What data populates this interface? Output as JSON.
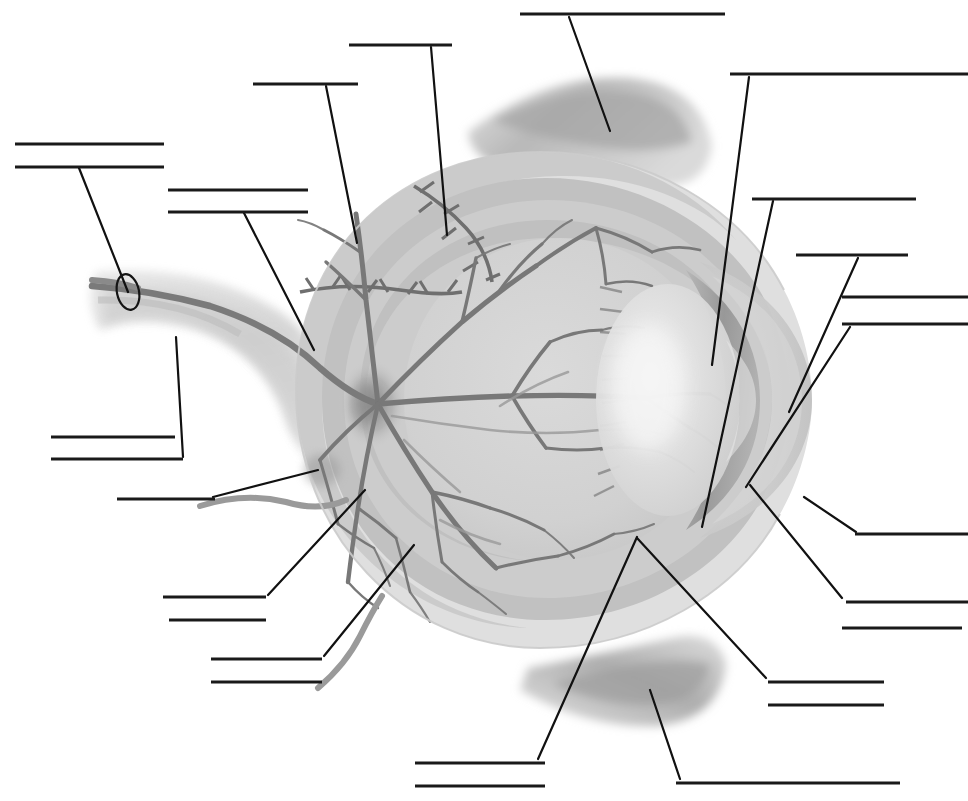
{
  "document": {
    "title": "Human Eye Anatomy - Blank Labeling Worksheet",
    "type": "unlabeled anatomical diagram",
    "orientation": "sagittal cross-section, anterior pole facing right",
    "rendering": "grayscale medical illustration",
    "width": 968,
    "height": 801
  },
  "palette": {
    "background": "#ffffff",
    "rule_line": "#1a1a1a",
    "leader_line": "#111111",
    "sclera_outer": "#dcdcdc",
    "sclera_shadow": "#c6c6c6",
    "choroid": "#bdbdbd",
    "retina_fill": "#cfcfcf",
    "vitreous": "#d4d4d4",
    "lens_highlight": "#f2f2f2",
    "cornea": "#c9c9c9",
    "iris_dark": "#9e9e9e",
    "muscle": "#b3b3b3",
    "muscle_dark": "#9a9a9a",
    "optic_nerve": "#d0d0d0",
    "vessel": "#7d7d7d",
    "vessel_dark": "#6b6b6b",
    "ciliary": "#6f6f6f",
    "marker_circle": "#151515"
  },
  "answer_lines": [
    {
      "id": 1,
      "text": "",
      "x1": 15,
      "y1": 144,
      "x2": 164,
      "y2": 144,
      "group": "left-upper"
    },
    {
      "id": 2,
      "text": "",
      "x1": 15,
      "y1": 167,
      "x2": 164,
      "y2": 167,
      "group": "left-upper"
    },
    {
      "id": 3,
      "text": "",
      "x1": 168,
      "y1": 190,
      "x2": 308,
      "y2": 190,
      "group": "left-mid"
    },
    {
      "id": 4,
      "text": "",
      "x1": 168,
      "y1": 212,
      "x2": 308,
      "y2": 212,
      "group": "left-mid"
    },
    {
      "id": 5,
      "text": "",
      "x1": 253,
      "y1": 84,
      "x2": 358,
      "y2": 84,
      "group": "top-left"
    },
    {
      "id": 6,
      "text": "",
      "x1": 349,
      "y1": 45,
      "x2": 452,
      "y2": 45,
      "group": "top-left"
    },
    {
      "id": 7,
      "text": "",
      "x1": 520,
      "y1": 14,
      "x2": 725,
      "y2": 14,
      "group": "top-center"
    },
    {
      "id": 8,
      "text": "",
      "x1": 730,
      "y1": 74,
      "x2": 968,
      "y2": 74,
      "group": "top-right"
    },
    {
      "id": 9,
      "text": "",
      "x1": 752,
      "y1": 199,
      "x2": 916,
      "y2": 199,
      "group": "right-upper"
    },
    {
      "id": 10,
      "text": "",
      "x1": 796,
      "y1": 255,
      "x2": 908,
      "y2": 255,
      "group": "right-upper"
    },
    {
      "id": 11,
      "text": "",
      "x1": 842,
      "y1": 297,
      "x2": 968,
      "y2": 297,
      "group": "right-mid"
    },
    {
      "id": 12,
      "text": "",
      "x1": 842,
      "y1": 324,
      "x2": 968,
      "y2": 324,
      "group": "right-mid"
    },
    {
      "id": 13,
      "text": "",
      "x1": 855,
      "y1": 534,
      "x2": 968,
      "y2": 534,
      "group": "right-lower"
    },
    {
      "id": 14,
      "text": "",
      "x1": 846,
      "y1": 602,
      "x2": 968,
      "y2": 602,
      "group": "right-lower"
    },
    {
      "id": 15,
      "text": "",
      "x1": 842,
      "y1": 628,
      "x2": 962,
      "y2": 628,
      "group": "right-lower"
    },
    {
      "id": 16,
      "text": "",
      "x1": 768,
      "y1": 682,
      "x2": 884,
      "y2": 682,
      "group": "right-bottom"
    },
    {
      "id": 17,
      "text": "",
      "x1": 768,
      "y1": 705,
      "x2": 884,
      "y2": 705,
      "group": "right-bottom"
    },
    {
      "id": 18,
      "text": "",
      "x1": 51,
      "y1": 437,
      "x2": 175,
      "y2": 437,
      "group": "left-lower"
    },
    {
      "id": 19,
      "text": "",
      "x1": 51,
      "y1": 459,
      "x2": 183,
      "y2": 459,
      "group": "left-lower"
    },
    {
      "id": 20,
      "text": "",
      "x1": 117,
      "y1": 499,
      "x2": 215,
      "y2": 499,
      "group": "left-lower"
    },
    {
      "id": 21,
      "text": "",
      "x1": 163,
      "y1": 597,
      "x2": 266,
      "y2": 597,
      "group": "bottom-left"
    },
    {
      "id": 22,
      "text": "",
      "x1": 169,
      "y1": 620,
      "x2": 266,
      "y2": 620,
      "group": "bottom-left"
    },
    {
      "id": 23,
      "text": "",
      "x1": 211,
      "y1": 659,
      "x2": 322,
      "y2": 659,
      "group": "bottom-left"
    },
    {
      "id": 24,
      "text": "",
      "x1": 211,
      "y1": 682,
      "x2": 322,
      "y2": 682,
      "group": "bottom-left"
    },
    {
      "id": 25,
      "text": "",
      "x1": 415,
      "y1": 763,
      "x2": 545,
      "y2": 763,
      "group": "bottom-center"
    },
    {
      "id": 26,
      "text": "",
      "x1": 415,
      "y1": 786,
      "x2": 545,
      "y2": 786,
      "group": "bottom-center"
    },
    {
      "id": 27,
      "text": "",
      "x1": 676,
      "y1": 783,
      "x2": 900,
      "y2": 783,
      "group": "bottom-right"
    }
  ],
  "leader_lines": [
    {
      "id": "L1",
      "from_line": 2,
      "x1": 79,
      "y1": 168,
      "x2": 128,
      "y2": 292
    },
    {
      "id": "L2",
      "from_line": 4,
      "x1": 244,
      "y1": 213,
      "x2": 314,
      "y2": 350
    },
    {
      "id": "L3",
      "from_line": 5,
      "x1": 326,
      "y1": 86,
      "x2": 357,
      "y2": 243
    },
    {
      "id": "L4",
      "from_line": 6,
      "x1": 431,
      "y1": 47,
      "x2": 447,
      "y2": 235
    },
    {
      "id": "L5",
      "from_line": 7,
      "x1": 569,
      "y1": 17,
      "x2": 610,
      "y2": 131
    },
    {
      "id": "L6",
      "from_line": 8,
      "x1": 749,
      "y1": 77,
      "x2": 712,
      "y2": 365
    },
    {
      "id": "L7",
      "from_line": 9,
      "x1": 773,
      "y1": 201,
      "x2": 702,
      "y2": 527
    },
    {
      "id": "L8",
      "from_line": 10,
      "x1": 858,
      "y1": 258,
      "x2": 789,
      "y2": 412
    },
    {
      "id": "L9",
      "from_line": 12,
      "x1": 850,
      "y1": 327,
      "x2": 746,
      "y2": 487
    },
    {
      "id": "L10",
      "from_line": 13,
      "x1": 856,
      "y1": 532,
      "x2": 804,
      "y2": 497
    },
    {
      "id": "L11",
      "from_line": 14,
      "x1": 842,
      "y1": 598,
      "x2": 750,
      "y2": 485
    },
    {
      "id": "L12",
      "from_line": 16,
      "x1": 766,
      "y1": 678,
      "x2": 637,
      "y2": 538
    },
    {
      "id": "L13",
      "from_line": 19,
      "x1": 183,
      "y1": 457,
      "x2": 176,
      "y2": 337
    },
    {
      "id": "L14",
      "from_line": 20,
      "x1": 213,
      "y1": 497,
      "x2": 318,
      "y2": 470
    },
    {
      "id": "L15",
      "from_line": 21,
      "x1": 268,
      "y1": 595,
      "x2": 365,
      "y2": 490
    },
    {
      "id": "L16",
      "from_line": 23,
      "x1": 324,
      "y1": 656,
      "x2": 414,
      "y2": 545
    },
    {
      "id": "L17",
      "from_line": 25,
      "x1": 538,
      "y1": 759,
      "x2": 637,
      "y2": 537
    },
    {
      "id": "L18",
      "from_line": 27,
      "x1": 680,
      "y1": 779,
      "x2": 650,
      "y2": 690
    }
  ],
  "markers": [
    {
      "id": "M1",
      "shape": "ellipse",
      "cx": 128,
      "cy": 292,
      "rx": 11,
      "ry": 18,
      "rotation": -12,
      "target": "central retinal vessel on optic nerve"
    }
  ],
  "illustration_parts": [
    {
      "name": "sclera",
      "description": "outer light-grey spherical coat of the eyeball"
    },
    {
      "name": "choroid",
      "description": "middle darker grey vascular layer beneath the sclera"
    },
    {
      "name": "retina",
      "description": "inner layer carrying the branching vessel tree"
    },
    {
      "name": "optic-nerve",
      "description": "broad pale stalk leaving the globe toward lower left"
    },
    {
      "name": "optic-disc",
      "description": "dark spot where vessels converge on the nasal retina"
    },
    {
      "name": "central-retinal-vessel",
      "description": "dark vessel running inside the optic nerve, circled"
    },
    {
      "name": "retinal-vessel-tree",
      "description": "dendritic grey vessels fanning across the fundus"
    },
    {
      "name": "lens",
      "description": "bright biconvex body at the anterior pole"
    },
    {
      "name": "cornea",
      "description": "pale dome bulging at the far right margin"
    },
    {
      "name": "iris",
      "description": "dark crescent band anterior to the lens"
    },
    {
      "name": "ciliary-body",
      "description": "dark toothed ring at the retina's anterior edge"
    },
    {
      "name": "ora-serrata",
      "description": "scalloped junction zone of retina and ciliary body"
    },
    {
      "name": "anterior-chamber",
      "description": "clear space between cornea and iris"
    },
    {
      "name": "vitreous-body",
      "description": "large pale interior chamber of the globe"
    },
    {
      "name": "superior-rectus-muscle",
      "description": "grey tapered muscle band across the top"
    },
    {
      "name": "inferior-rectus-muscle",
      "description": "grey tapered muscle band across the bottom"
    },
    {
      "name": "suspensory-ligaments",
      "description": "fine fibres between ciliary body and lens"
    }
  ]
}
